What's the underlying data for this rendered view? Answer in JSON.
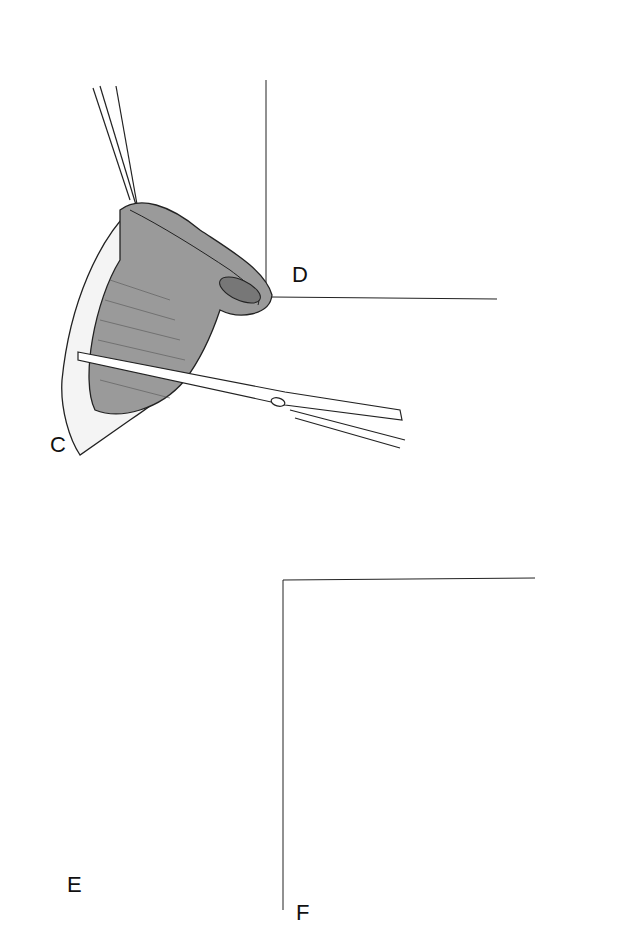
{
  "figure": {
    "panels": [
      {
        "id": "C",
        "label": "C",
        "description": "Everted tissue cone held by forceps, incised with scissors"
      },
      {
        "id": "D",
        "label": "D",
        "description": "Excision of tissue cuff with scissors"
      },
      {
        "id": "E",
        "label": "E",
        "description": "Tubular reconstruction with interrupted sutures and drain/catheter"
      },
      {
        "id": "F",
        "label": "F",
        "description": "T-shaped final suture line closure"
      }
    ],
    "colors": {
      "line": "#1a1a1a",
      "tissue_fill": "#9a9a9a",
      "background": "#ffffff"
    }
  }
}
